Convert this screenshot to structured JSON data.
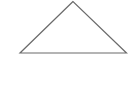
{
  "diagram": {
    "background": "#ffffff",
    "shapes": [
      {
        "type": "triangle",
        "fill": "none",
        "stroke": "#6b6b6b",
        "stroke_width": 1.2,
        "points": [
          [
            73,
            1.5
          ],
          [
            20,
            53
          ],
          [
            126.5,
            53
          ]
        ]
      }
    ]
  }
}
